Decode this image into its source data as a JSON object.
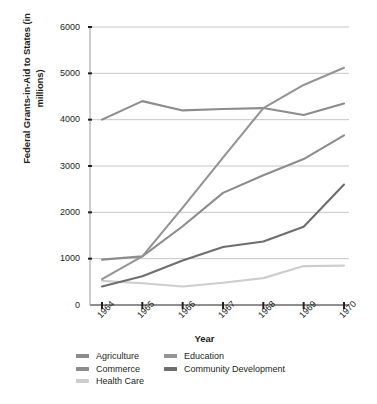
{
  "chart_data": {
    "type": "line",
    "title": "",
    "xlabel": "Year",
    "ylabel": "Federal Grants-in-Aid to States (in millions)",
    "categories": [
      "1964",
      "1965",
      "1966",
      "1967",
      "1968",
      "1969",
      "1970"
    ],
    "x": [
      1964,
      1965,
      1966,
      1967,
      1968,
      1969,
      1970
    ],
    "ylim": [
      0,
      6000
    ],
    "yticks": [
      0,
      1000,
      2000,
      3000,
      4000,
      5000,
      6000
    ],
    "ytick_labels": [
      "0",
      "1000",
      "2000",
      "3000",
      "4000",
      "5000",
      "6000"
    ],
    "grid": "horizontal",
    "legend_position": "bottom",
    "series": [
      {
        "name": "Agriculture",
        "color": "#8c8c8c",
        "values": [
          4000,
          4400,
          4200,
          4230,
          4250,
          4100,
          4350
        ]
      },
      {
        "name": "Commerce",
        "color": "#8c8c8c",
        "values": [
          980,
          1050,
          1700,
          2420,
          2800,
          3150,
          3660
        ]
      },
      {
        "name": "Health Care",
        "color": "#cdcdcd",
        "values": [
          520,
          470,
          400,
          480,
          580,
          840,
          850
        ]
      },
      {
        "name": "Education",
        "color": "#949494",
        "values": [
          560,
          1050,
          2100,
          3180,
          4250,
          4750,
          5120
        ]
      },
      {
        "name": "Community Development",
        "color": "#6e6e6e",
        "values": [
          400,
          620,
          960,
          1250,
          1370,
          1690,
          2600
        ]
      }
    ]
  },
  "axis": {
    "y_title": "Federal Grants-in-Aid to States (in millions)",
    "x_title": "Year"
  },
  "legend": {
    "column_left": [
      {
        "label": "Agriculture",
        "color": "#8c8c8c"
      },
      {
        "label": "Commerce",
        "color": "#8c8c8c"
      },
      {
        "label": "Health Care",
        "color": "#cdcdcd"
      }
    ],
    "column_right": [
      {
        "label": "Education",
        "color": "#949494"
      },
      {
        "label": "Community Development",
        "color": "#6e6e6e"
      }
    ]
  },
  "colors": {
    "axis": "#231f20",
    "gridline": "#b7b7b7",
    "background": "#ffffff"
  }
}
